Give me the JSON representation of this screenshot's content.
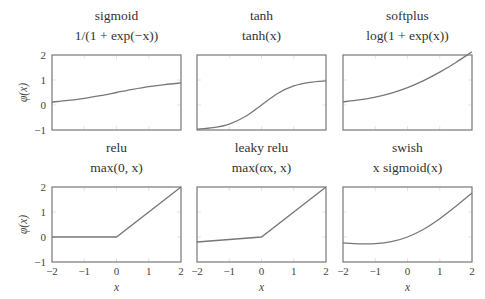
{
  "figure": {
    "ylabel": "φ(x)",
    "xlabel": "x",
    "xticks": [
      "−2",
      "−1",
      "0",
      "1",
      "2"
    ],
    "yticks": [
      "2",
      "1",
      "0",
      "−1"
    ]
  },
  "chart_data": [
    {
      "type": "line",
      "title": "sigmoid",
      "subtitle": "1/(1 + exp(−x))",
      "xlabel": "",
      "ylabel": "φ(x)",
      "xlim": [
        -2,
        2
      ],
      "ylim": [
        -1,
        2
      ],
      "series": [
        {
          "name": "sigmoid",
          "x": [
            -2,
            -1.5,
            -1,
            -0.5,
            0,
            0.5,
            1,
            1.5,
            2
          ],
          "y": [
            0.119,
            0.182,
            0.269,
            0.378,
            0.5,
            0.622,
            0.731,
            0.818,
            0.881
          ]
        }
      ]
    },
    {
      "type": "line",
      "title": "tanh",
      "subtitle": "tanh(x)",
      "xlabel": "",
      "ylabel": "",
      "xlim": [
        -2,
        2
      ],
      "ylim": [
        -1,
        2
      ],
      "series": [
        {
          "name": "tanh",
          "x": [
            -2,
            -1.5,
            -1,
            -0.5,
            0,
            0.5,
            1,
            1.5,
            2
          ],
          "y": [
            -0.964,
            -0.905,
            -0.762,
            -0.462,
            0,
            0.462,
            0.762,
            0.905,
            0.964
          ]
        }
      ]
    },
    {
      "type": "line",
      "title": "softplus",
      "subtitle": "log(1 + exp(x))",
      "xlabel": "",
      "ylabel": "",
      "xlim": [
        -2,
        2
      ],
      "ylim": [
        -1,
        2
      ],
      "series": [
        {
          "name": "softplus",
          "x": [
            -2,
            -1.5,
            -1,
            -0.5,
            0,
            0.5,
            1,
            1.5,
            2
          ],
          "y": [
            0.127,
            0.201,
            0.313,
            0.474,
            0.693,
            0.974,
            1.313,
            1.701,
            2.127
          ]
        }
      ]
    },
    {
      "type": "line",
      "title": "relu",
      "subtitle": "max(0, x)",
      "xlabel": "x",
      "ylabel": "φ(x)",
      "xlim": [
        -2,
        2
      ],
      "ylim": [
        -1,
        2
      ],
      "series": [
        {
          "name": "relu",
          "x": [
            -2,
            0,
            2
          ],
          "y": [
            0,
            0,
            2
          ]
        }
      ]
    },
    {
      "type": "line",
      "title": "leaky relu",
      "subtitle": "max(αx, x)",
      "xlabel": "x",
      "ylabel": "",
      "xlim": [
        -2,
        2
      ],
      "ylim": [
        -1,
        2
      ],
      "series": [
        {
          "name": "leaky relu",
          "x": [
            -2,
            0,
            2
          ],
          "y": [
            -0.2,
            0,
            2
          ]
        }
      ]
    },
    {
      "type": "line",
      "title": "swish",
      "subtitle": "x sigmoid(x)",
      "xlabel": "x",
      "ylabel": "",
      "xlim": [
        -2,
        2
      ],
      "ylim": [
        -1,
        2
      ],
      "series": [
        {
          "name": "swish",
          "x": [
            -2,
            -1.5,
            -1,
            -0.5,
            0,
            0.5,
            1,
            1.5,
            2
          ],
          "y": [
            -0.238,
            -0.273,
            -0.269,
            -0.189,
            0,
            0.311,
            0.731,
            1.227,
            1.762
          ]
        }
      ]
    }
  ]
}
